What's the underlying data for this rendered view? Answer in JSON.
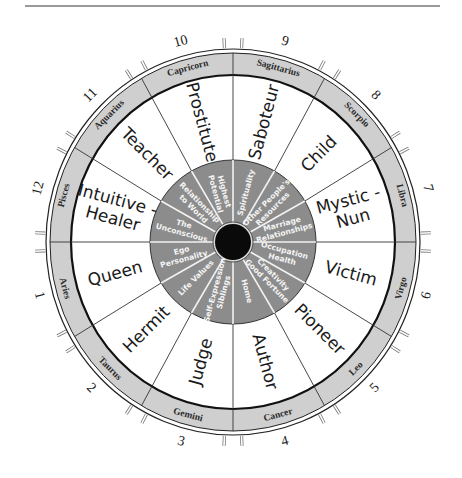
{
  "diagram": {
    "type": "astrological-archetype-wheel",
    "center": {
      "x": 233,
      "y": 242
    },
    "colors": {
      "band": "#cfcfcf",
      "inner_ring": "#8c8c8c",
      "hub": "#0a0a0a",
      "lines": "#222222",
      "inner_text": "#f4f4f4",
      "background": "#ffffff"
    },
    "sectors": [
      {
        "angle": 15,
        "house": "9",
        "sign": "Sagittarius",
        "archetype": [
          "Saboteur"
        ],
        "inner": [
          "Spirituality"
        ]
      },
      {
        "angle": 45,
        "house": "8",
        "sign": "Scorpio",
        "archetype": [
          "Child"
        ],
        "inner": [
          "Other People's",
          "Resources"
        ]
      },
      {
        "angle": 75,
        "house": "7",
        "sign": "Libra",
        "archetype": [
          "Mystic -",
          "Nun"
        ],
        "inner": [
          "Marriage",
          "Relationships"
        ]
      },
      {
        "angle": 105,
        "house": "6",
        "sign": "Virgo",
        "archetype": [
          "Victim"
        ],
        "inner": [
          "Occupation",
          "Health"
        ]
      },
      {
        "angle": 135,
        "house": "5",
        "sign": "Leo",
        "archetype": [
          "Pioneer"
        ],
        "inner": [
          "Creativity",
          "Good Fortune"
        ]
      },
      {
        "angle": 165,
        "house": "4",
        "sign": "Cancer",
        "archetype": [
          "Author"
        ],
        "inner": [
          "Home"
        ]
      },
      {
        "angle": 195,
        "house": "3",
        "sign": "Gemini",
        "archetype": [
          "Judge"
        ],
        "inner": [
          "Self-Expression",
          "Siblings"
        ]
      },
      {
        "angle": 225,
        "house": "2",
        "sign": "Taurus",
        "archetype": [
          "Hermit"
        ],
        "inner": [
          "Life Values"
        ]
      },
      {
        "angle": 255,
        "house": "1",
        "sign": "Aries",
        "archetype": [
          "Queen"
        ],
        "inner": [
          "Ego",
          "Personality"
        ]
      },
      {
        "angle": 285,
        "house": "12",
        "sign": "Pisces",
        "archetype": [
          "Intuitive -",
          "Healer"
        ],
        "inner": [
          "The",
          "Unconscious"
        ]
      },
      {
        "angle": 315,
        "house": "11",
        "sign": "Aquarius",
        "archetype": [
          "Teacher"
        ],
        "inner": [
          "Relationship",
          "to World"
        ]
      },
      {
        "angle": 345,
        "house": "10",
        "sign": "Capricorn",
        "archetype": [
          "Prostitute"
        ],
        "inner": [
          "Highest",
          "Potential"
        ]
      }
    ]
  }
}
